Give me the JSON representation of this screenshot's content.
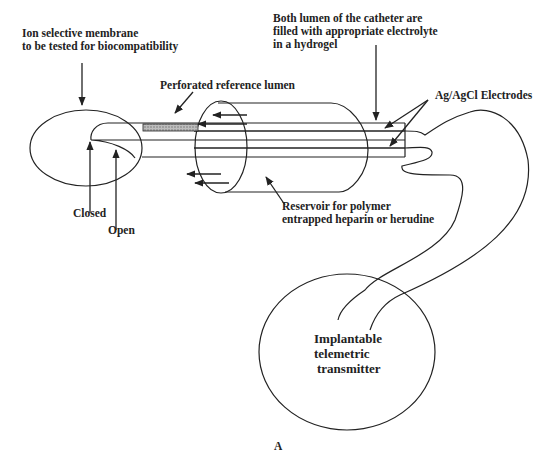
{
  "diagram": {
    "type": "implantable-sensor-schematic",
    "labels": {
      "membrane": [
        "Ion selective membrane",
        "to be tested for biocompatibility"
      ],
      "lumens": [
        "Both lumen of the catheter are",
        "filled with appropriate electrolyte",
        "in a hydrogel"
      ],
      "reference_lumen": "Perforated reference lumen",
      "electrodes": "Ag/AgCl Electrodes",
      "closed": "Closed",
      "open": "Open",
      "reservoir": [
        "Reservoir for polymer",
        "entrapped heparin or herudine"
      ],
      "transmitter": [
        "Implantable",
        "telemetric",
        "transmitter"
      ],
      "panel": "A"
    },
    "components": [
      "membrane-ellipse",
      "catheter-lumens",
      "perforated-reference-segment",
      "reservoir-cylinder",
      "ag-agcl-electrodes",
      "connecting-cable",
      "telemetric-transmitter"
    ],
    "colors": {
      "stroke": "#222222",
      "hatch": "#9a9a9a",
      "background": "#ffffff"
    }
  }
}
